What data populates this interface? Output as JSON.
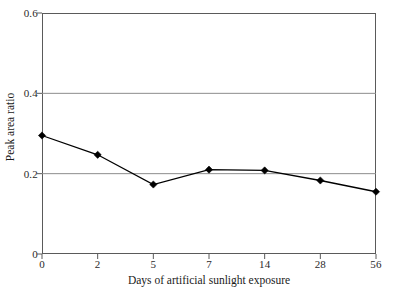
{
  "figure": {
    "background_color": "#ffffff",
    "frame_color": "#5a5a5a",
    "grid_color": "#8c8c8c",
    "series_color": "#000000"
  },
  "chart_data": {
    "type": "line",
    "title": "",
    "subtitle": "",
    "xlabel": "Days of artificial sunlight exposure",
    "ylabel": "Peak area ratio",
    "categories": [
      "0",
      "2",
      "5",
      "7",
      "14",
      "28",
      "56"
    ],
    "values": [
      0.295,
      0.247,
      0.173,
      0.21,
      0.208,
      0.183,
      0.155
    ],
    "series": [
      {
        "name": "Peak area ratio",
        "values": [
          0.295,
          0.247,
          0.173,
          0.21,
          0.208,
          0.183,
          0.155
        ],
        "marker": "diamond",
        "marker_color": "#000000",
        "line_color": "#000000"
      }
    ],
    "ylim": [
      0,
      0.6
    ],
    "yticks": [
      0,
      0.2,
      0.4,
      0.6
    ],
    "ytick_labels": [
      "0",
      "0.2",
      "0.4",
      "0.6"
    ],
    "xtick_labels": [
      "0",
      "2",
      "5",
      "7",
      "14",
      "28",
      "56"
    ],
    "grid": "horizontal-major",
    "gridlines_at": [
      0.2,
      0.4
    ],
    "legend": "none",
    "legend_position": "none",
    "annotations": []
  }
}
